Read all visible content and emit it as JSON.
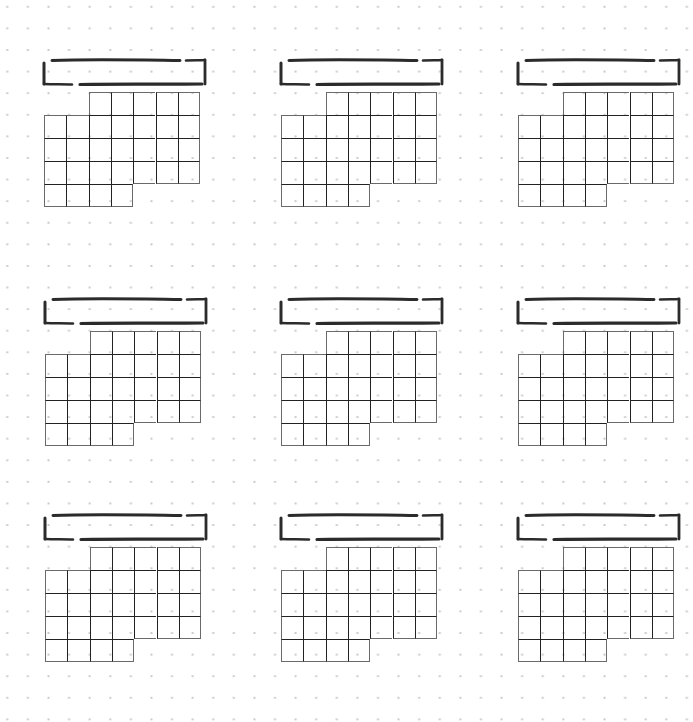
{
  "page": {
    "faint_title": "",
    "background": "dot-grid",
    "dot_color": "#c9c9c9",
    "line_color": "#222222",
    "outline_color": "#6a6a6a"
  },
  "calendar_template": {
    "columns": 7,
    "rows": [
      {
        "start_col": 2,
        "count": 5
      },
      {
        "start_col": 0,
        "count": 7
      },
      {
        "start_col": 0,
        "count": 7
      },
      {
        "start_col": 0,
        "count": 7
      },
      {
        "start_col": 0,
        "count": 4
      }
    ]
  },
  "blocks": [
    {
      "id": "month-1",
      "x": 44,
      "y": 92,
      "header_label": ""
    },
    {
      "id": "month-2",
      "x": 281,
      "y": 92,
      "header_label": ""
    },
    {
      "id": "month-3",
      "x": 518,
      "y": 92,
      "header_label": ""
    },
    {
      "id": "month-4",
      "x": 45,
      "y": 331,
      "header_label": ""
    },
    {
      "id": "month-5",
      "x": 281,
      "y": 331,
      "header_label": ""
    },
    {
      "id": "month-6",
      "x": 518,
      "y": 331,
      "header_label": ""
    },
    {
      "id": "month-7",
      "x": 45,
      "y": 547,
      "header_label": ""
    },
    {
      "id": "month-8",
      "x": 281,
      "y": 547,
      "header_label": ""
    },
    {
      "id": "month-9",
      "x": 518,
      "y": 547,
      "header_label": ""
    }
  ]
}
